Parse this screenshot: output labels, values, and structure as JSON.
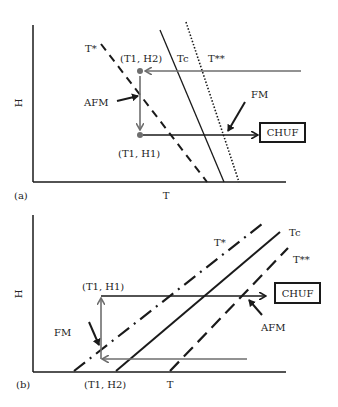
{
  "panel_a": {
    "tag": "(a)",
    "x_axis_label": "T",
    "y_axis_label": "H",
    "lines": {
      "t_star": "T*",
      "t_c": "Tc",
      "t_double_star": "T**"
    },
    "points": {
      "upper": "(T1, H2)",
      "lower": "(T1, H1)"
    },
    "annotations": {
      "afm": "AFM",
      "fm": "FM"
    },
    "box_label": "CHUF"
  },
  "panel_b": {
    "tag": "(b)",
    "x_axis_label": "T",
    "y_axis_label": "H",
    "lines": {
      "t_star": "T*",
      "t_c": "Tc",
      "t_double_star": "T**"
    },
    "points": {
      "upper": "(T1, H1)",
      "lower": "(T1, H2)"
    },
    "annotations": {
      "afm": "AFM",
      "fm": "FM"
    },
    "box_label": "CHUF"
  },
  "colors": {
    "line": "#1a1a1a",
    "path": "#6e6e6e"
  }
}
